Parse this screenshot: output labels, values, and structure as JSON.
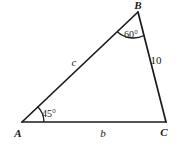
{
  "figure": {
    "name": "triangle-abc-diagram",
    "type": "geometry-triangle",
    "background_color": "#ffffff",
    "stroke_color": "#1b1b1b",
    "vertices": {
      "A": {
        "label": "A",
        "x": 22,
        "y": 122
      },
      "B": {
        "label": "B",
        "x": 138,
        "y": 12
      },
      "C": {
        "label": "C",
        "x": 166,
        "y": 122
      }
    },
    "sides": [
      {
        "name": "side-AB",
        "label": "c",
        "from": "A",
        "to": "B",
        "label_x": 74,
        "label_y": 62
      },
      {
        "name": "side-AC",
        "label": "b",
        "from": "A",
        "to": "C",
        "label_x": 103,
        "label_y": 133
      },
      {
        "name": "side-BC",
        "label": "10",
        "from": "B",
        "to": "C",
        "label_x": 156,
        "label_y": 60
      }
    ],
    "angles": [
      {
        "name": "angle-at-A",
        "label": "45°",
        "vertex": "A",
        "label_x": 49,
        "label_y": 114,
        "arc_radius": 22
      },
      {
        "name": "angle-at-B",
        "label": "60°",
        "vertex": "B",
        "label_x": 131,
        "label_y": 35,
        "arc_radius": 24
      }
    ],
    "vertex_labels": {
      "A": "A",
      "B": "B",
      "C": "C"
    },
    "side_labels": {
      "c": "c",
      "b": "b",
      "bc_length": "10"
    },
    "angle_labels": {
      "at_A": "45°",
      "at_B": "60°"
    }
  }
}
